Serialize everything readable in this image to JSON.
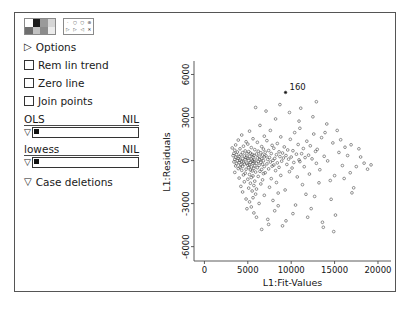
{
  "window": {
    "title": ""
  },
  "toolbar": {
    "palette_icon": "color-palette-icon",
    "palette_cells": [
      "#ffffff",
      "#1c1c1c",
      "#9a9a9a",
      "#d6d6d6",
      "#6e6e6e",
      "#c2c2c2",
      "#8c8c8c",
      "#ececec"
    ],
    "symbol_icon": "plot-symbol-icon",
    "symbols": [
      "·",
      "○",
      "○",
      "⊕",
      "▷",
      "▷",
      "◁",
      "✕"
    ]
  },
  "panel": {
    "options_label": "Options",
    "options_arrow": "triangle-right",
    "checkboxes": [
      {
        "label": "Rem lin trend",
        "checked": false
      },
      {
        "label": "Zero line",
        "checked": false
      },
      {
        "label": "Join points",
        "checked": false
      }
    ],
    "sliders": [
      {
        "name": "OLS",
        "value_label": "NIL",
        "handle": "▽",
        "fill_pct": 5
      },
      {
        "name": "lowess",
        "value_label": "NIL",
        "handle": "▽",
        "fill_pct": 5
      }
    ],
    "case_deletions": {
      "label": "Case deletions",
      "arrow": "▽"
    }
  },
  "chart_data": {
    "type": "scatter",
    "title": "",
    "xlabel": "L1:Fit-Values",
    "ylabel": "L1:Residuals",
    "xlim": [
      -1200,
      21500
    ],
    "ylim": [
      -7000,
      6800
    ],
    "xticks": [
      0,
      5000,
      10000,
      15000,
      20000
    ],
    "yticks": [
      -6000,
      -3000,
      0,
      3000,
      6000
    ],
    "grid": false,
    "legend": null,
    "marker": "open-circle",
    "annotations": [
      {
        "label": "160",
        "x": 9350,
        "y": 4750
      }
    ],
    "points": [
      [
        9350,
        4750
      ],
      [
        8200,
        2900
      ],
      [
        6400,
        2450
      ],
      [
        11000,
        2250
      ],
      [
        7600,
        2100
      ],
      [
        5200,
        2050
      ],
      [
        10400,
        1950
      ],
      [
        12600,
        1850
      ],
      [
        4300,
        1780
      ],
      [
        6900,
        1700
      ],
      [
        8800,
        1650
      ],
      [
        13500,
        1600
      ],
      [
        5600,
        1520
      ],
      [
        9900,
        1480
      ],
      [
        3900,
        1430
      ],
      [
        7200,
        1390
      ],
      [
        11800,
        1350
      ],
      [
        4800,
        1310
      ],
      [
        6100,
        1270
      ],
      [
        14800,
        1230
      ],
      [
        8400,
        1190
      ],
      [
        5000,
        1150
      ],
      [
        10800,
        1120
      ],
      [
        3600,
        1090
      ],
      [
        7800,
        1060
      ],
      [
        12200,
        1030
      ],
      [
        4500,
        1000
      ],
      [
        6600,
        975
      ],
      [
        9200,
        950
      ],
      [
        16200,
        930
      ],
      [
        5400,
        905
      ],
      [
        3200,
        880
      ],
      [
        8000,
        860
      ],
      [
        11400,
        840
      ],
      [
        4100,
        820
      ],
      [
        6800,
        800
      ],
      [
        13000,
        780
      ],
      [
        5800,
        760
      ],
      [
        9600,
        740
      ],
      [
        3500,
        720
      ],
      [
        7400,
        700
      ],
      [
        10200,
        685
      ],
      [
        4700,
        670
      ],
      [
        6200,
        655
      ],
      [
        12800,
        640
      ],
      [
        5100,
        625
      ],
      [
        8600,
        610
      ],
      [
        3800,
        595
      ],
      [
        7000,
        580
      ],
      [
        15500,
        565
      ],
      [
        4400,
        552
      ],
      [
        6500,
        540
      ],
      [
        9000,
        528
      ],
      [
        5300,
        516
      ],
      [
        3400,
        504
      ],
      [
        7700,
        492
      ],
      [
        11200,
        480
      ],
      [
        4900,
        468
      ],
      [
        6000,
        456
      ],
      [
        10600,
        444
      ],
      [
        5500,
        432
      ],
      [
        3700,
        420
      ],
      [
        8300,
        408
      ],
      [
        4200,
        396
      ],
      [
        6700,
        385
      ],
      [
        12000,
        374
      ],
      [
        5700,
        363
      ],
      [
        9400,
        352
      ],
      [
        3300,
        341
      ],
      [
        7100,
        330
      ],
      [
        4600,
        319
      ],
      [
        6300,
        308
      ],
      [
        13800,
        298
      ],
      [
        5200,
        288
      ],
      [
        8700,
        278
      ],
      [
        4000,
        268
      ],
      [
        6900,
        258
      ],
      [
        10000,
        248
      ],
      [
        5600,
        238
      ],
      [
        3600,
        228
      ],
      [
        7500,
        218
      ],
      [
        11600,
        208
      ],
      [
        4800,
        198
      ],
      [
        6100,
        188
      ],
      [
        9100,
        178
      ],
      [
        5000,
        168
      ],
      [
        3900,
        158
      ],
      [
        8100,
        148
      ],
      [
        4400,
        138
      ],
      [
        6600,
        128
      ],
      [
        12400,
        118
      ],
      [
        5400,
        108
      ],
      [
        9700,
        98
      ],
      [
        3500,
        88
      ],
      [
        7300,
        78
      ],
      [
        4700,
        68
      ],
      [
        6400,
        58
      ],
      [
        10900,
        48
      ],
      [
        5800,
        38
      ],
      [
        4100,
        28
      ],
      [
        7900,
        18
      ],
      [
        5100,
        8
      ],
      [
        3800,
        -2
      ],
      [
        6800,
        -12
      ],
      [
        14200,
        -22
      ],
      [
        5500,
        -32
      ],
      [
        8900,
        -42
      ],
      [
        4300,
        -52
      ],
      [
        6200,
        -62
      ],
      [
        11000,
        -72
      ],
      [
        5700,
        -82
      ],
      [
        3400,
        -92
      ],
      [
        7600,
        -102
      ],
      [
        4500,
        -112
      ],
      [
        6500,
        -122
      ],
      [
        10300,
        -132
      ],
      [
        5300,
        -142
      ],
      [
        4000,
        -152
      ],
      [
        8400,
        -162
      ],
      [
        4900,
        -172
      ],
      [
        6000,
        -182
      ],
      [
        12900,
        -192
      ],
      [
        5600,
        -205
      ],
      [
        3700,
        -218
      ],
      [
        7200,
        -231
      ],
      [
        4600,
        -244
      ],
      [
        6700,
        -257
      ],
      [
        9500,
        -270
      ],
      [
        5200,
        -283
      ],
      [
        4200,
        -296
      ],
      [
        8000,
        -309
      ],
      [
        5000,
        -322
      ],
      [
        6300,
        -335
      ],
      [
        15900,
        -348
      ],
      [
        5800,
        -361
      ],
      [
        3600,
        -374
      ],
      [
        7800,
        -388
      ],
      [
        4400,
        -402
      ],
      [
        6900,
        -416
      ],
      [
        11500,
        -430
      ],
      [
        5400,
        -444
      ],
      [
        4100,
        -458
      ],
      [
        8600,
        -472
      ],
      [
        5100,
        -486
      ],
      [
        6100,
        -500
      ],
      [
        10100,
        -520
      ],
      [
        5700,
        -540
      ],
      [
        3900,
        -560
      ],
      [
        7400,
        -580
      ],
      [
        4800,
        -600
      ],
      [
        6600,
        -620
      ],
      [
        13300,
        -640
      ],
      [
        5300,
        -660
      ],
      [
        4300,
        -680
      ],
      [
        8200,
        -700
      ],
      [
        5500,
        -725
      ],
      [
        6400,
        -750
      ],
      [
        9800,
        -775
      ],
      [
        5900,
        -800
      ],
      [
        3500,
        -825
      ],
      [
        7000,
        -850
      ],
      [
        4700,
        -880
      ],
      [
        6800,
        -910
      ],
      [
        12100,
        -940
      ],
      [
        5200,
        -970
      ],
      [
        4500,
        -1000
      ],
      [
        8800,
        -1035
      ],
      [
        5600,
        -1070
      ],
      [
        6200,
        -1105
      ],
      [
        10700,
        -1140
      ],
      [
        5400,
        -1180
      ],
      [
        4000,
        -1220
      ],
      [
        7700,
        -1260
      ],
      [
        5000,
        -1300
      ],
      [
        6700,
        -1345
      ],
      [
        14500,
        -1390
      ],
      [
        5800,
        -1435
      ],
      [
        4600,
        -1480
      ],
      [
        8300,
        -1530
      ],
      [
        5300,
        -1580
      ],
      [
        6500,
        -1630
      ],
      [
        11300,
        -1680
      ],
      [
        5700,
        -1740
      ],
      [
        4200,
        -1800
      ],
      [
        7500,
        -1860
      ],
      [
        5100,
        -1920
      ],
      [
        6000,
        -1985
      ],
      [
        9300,
        -2050
      ],
      [
        5500,
        -2120
      ],
      [
        4400,
        -2190
      ],
      [
        8500,
        -2265
      ],
      [
        5900,
        -2340
      ],
      [
        6900,
        -2420
      ],
      [
        12700,
        -2500
      ],
      [
        5600,
        -2590
      ],
      [
        4800,
        -2680
      ],
      [
        7900,
        -2780
      ],
      [
        5200,
        -2880
      ],
      [
        6300,
        -2990
      ],
      [
        10500,
        -3100
      ],
      [
        5400,
        -3230
      ],
      [
        4900,
        -3360
      ],
      [
        8100,
        -3500
      ],
      [
        5700,
        -3650
      ],
      [
        15100,
        -3800
      ],
      [
        11900,
        -3950
      ],
      [
        7300,
        -4100
      ],
      [
        13600,
        -4300
      ],
      [
        9000,
        -4550
      ],
      [
        6600,
        -4800
      ],
      [
        14900,
        -4950
      ],
      [
        16800,
        -850
      ],
      [
        17500,
        -420
      ],
      [
        18400,
        -180
      ],
      [
        16500,
        350
      ],
      [
        17800,
        820
      ],
      [
        15700,
        1450
      ],
      [
        16100,
        -1250
      ],
      [
        17200,
        -1900
      ],
      [
        18800,
        -600
      ],
      [
        15300,
        2100
      ],
      [
        14100,
        2550
      ],
      [
        13200,
        -1550
      ],
      [
        12500,
        3050
      ],
      [
        11700,
        -2350
      ],
      [
        10900,
        2750
      ],
      [
        19200,
        -300
      ],
      [
        16900,
        1100
      ],
      [
        18000,
        250
      ],
      [
        14600,
        -2700
      ],
      [
        13900,
        1950
      ],
      [
        15000,
        -1050
      ],
      [
        17000,
        -2250
      ],
      [
        12300,
        -3350
      ],
      [
        9800,
        3350
      ],
      [
        8500,
        -3150
      ],
      [
        7100,
        3450
      ],
      [
        10200,
        -3700
      ],
      [
        11100,
        3650
      ],
      [
        6000,
        -3950
      ],
      [
        9400,
        -4200
      ],
      [
        12900,
        4100
      ],
      [
        8700,
        3900
      ],
      [
        7400,
        -4450
      ],
      [
        5900,
        3700
      ],
      [
        13700,
        -4650
      ]
    ]
  }
}
